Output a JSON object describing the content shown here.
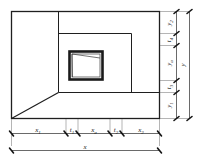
{
  "diagram": {
    "line_color": "#1f1f1f",
    "dimension_color": "#2a2a2a",
    "background": "#ffffff",
    "horizontal_chain": {
      "overall_label": "x",
      "overall_sub": "",
      "segments": [
        {
          "label": "x",
          "sub": "1",
          "name": "x1"
        },
        {
          "label": "t",
          "sub": "1",
          "name": "t1"
        },
        {
          "label": "x",
          "sub": "a",
          "name": "xa"
        },
        {
          "label": "t",
          "sub": "2",
          "name": "t2"
        },
        {
          "label": "x",
          "sub": "2",
          "name": "x2"
        }
      ]
    },
    "vertical_chain": {
      "overall_label": "y",
      "overall_sub": "",
      "segments": [
        {
          "label": "y",
          "sub": "2",
          "name": "y2"
        },
        {
          "label": "t",
          "sub": "4",
          "name": "t4"
        },
        {
          "label": "y",
          "sub": "a",
          "name": "ya"
        },
        {
          "label": "t",
          "sub": "3",
          "name": "t3"
        },
        {
          "label": "y",
          "sub": "1",
          "name": "y1"
        }
      ]
    },
    "features": {
      "outer_wall": "outer-boundary-rectangle",
      "mid_wall": "inner-chamber-rectangle",
      "opening": "central-opening-frame",
      "floor_diagonal": "perspective-floor-edge"
    }
  }
}
